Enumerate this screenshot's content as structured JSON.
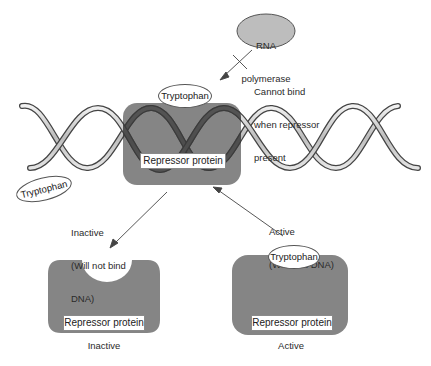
{
  "diagram": {
    "title": "",
    "colors": {
      "protein": "#7d7d7d",
      "rna_polymerase": "#bdbdbd",
      "dna_strand_dark": "#3a3a3a",
      "dna_strand_light": "#d8d8d8",
      "arrow": "#444444"
    },
    "rna_polymerase": {
      "label_line1": "RNA",
      "label_line2": "polymerase"
    },
    "blocked_note": {
      "line1": "Cannot bind",
      "line2": "when repressor",
      "line3": "present"
    },
    "bound_complex": {
      "ligand_label": "Tryptophan",
      "protein_label": "Repressor protein"
    },
    "free_tryptophan": {
      "label": "Tryptophan"
    },
    "inactive_arrow_note": {
      "line1": "Inactive",
      "line2": "(Will not bind",
      "line3": "DNA)"
    },
    "active_arrow_note": {
      "line1": "Active",
      "line2": "(Will bind DNA)"
    },
    "inactive_repressor": {
      "protein_label": "Repressor protein",
      "caption": "Inactive"
    },
    "active_repressor": {
      "ligand_label": "Tryptophan",
      "protein_label": "Repressor protein",
      "caption": "Active"
    }
  }
}
